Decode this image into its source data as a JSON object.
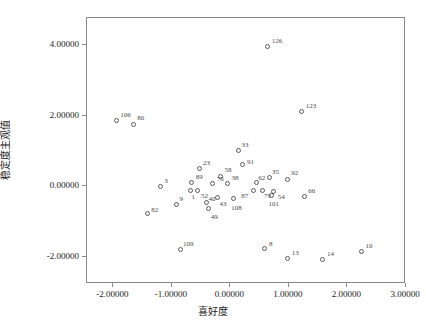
{
  "chart_data": {
    "type": "scatter",
    "title": "",
    "xlabel": "喜好度",
    "ylabel": "稳定度主观值",
    "xlim": [
      -2.45,
      3.0
    ],
    "ylim": [
      -2.75,
      4.75
    ],
    "grid": false,
    "legend": null,
    "xticks": [
      -2.0,
      -1.0,
      0.0,
      1.0,
      2.0,
      3.0
    ],
    "xtick_labels": [
      "-2.00000",
      "-1.00000",
      "0.00000",
      "1.00000",
      "2.00000",
      "3.00000"
    ],
    "yticks": [
      -2.0,
      0.0,
      2.0,
      4.0
    ],
    "ytick_labels": [
      "-2.00000",
      "0.00000",
      "2.00000",
      "4.00000"
    ],
    "point_color": "#5a5a5a",
    "marker": "open-circle",
    "labels_shown": true,
    "points": [
      {
        "label": "126",
        "x": 0.64,
        "y": 3.94,
        "lx": 4,
        "ly": -9
      },
      {
        "label": "123",
        "x": 1.22,
        "y": 2.11,
        "lx": 4,
        "ly": -9
      },
      {
        "label": "106",
        "x": -1.95,
        "y": 1.85,
        "lx": 4,
        "ly": -9
      },
      {
        "label": "80",
        "x": -1.66,
        "y": 1.76,
        "lx": 4,
        "ly": -9
      },
      {
        "label": "33",
        "x": 0.14,
        "y": 1.01,
        "lx": 3,
        "ly": -9
      },
      {
        "label": "91",
        "x": 0.2,
        "y": 0.62,
        "lx": 5,
        "ly": -5
      },
      {
        "label": "23",
        "x": -0.52,
        "y": 0.5,
        "lx": 3,
        "ly": -9
      },
      {
        "label": "58",
        "x": -0.17,
        "y": 0.29,
        "lx": 4,
        "ly": -9
      },
      {
        "label": "35",
        "x": 0.66,
        "y": 0.25,
        "lx": 3,
        "ly": -9
      },
      {
        "label": "92",
        "x": 0.97,
        "y": 0.21,
        "lx": 4,
        "ly": -9
      },
      {
        "label": "89",
        "x": -0.66,
        "y": 0.12,
        "lx": 4,
        "ly": -8
      },
      {
        "label": "76",
        "x": -0.3,
        "y": 0.08,
        "lx": 4,
        "ly": -8
      },
      {
        "label": "38",
        "x": -0.05,
        "y": 0.09,
        "lx": 4,
        "ly": -8
      },
      {
        "label": "62",
        "x": 0.44,
        "y": 0.1,
        "lx": 2,
        "ly": -8
      },
      {
        "label": "3",
        "x": -1.2,
        "y": 0.0,
        "lx": 4,
        "ly": -8
      },
      {
        "label": "1",
        "x": -0.68,
        "y": -0.1,
        "lx": 1,
        "ly": 4
      },
      {
        "label": "52",
        "x": -0.57,
        "y": -0.1,
        "lx": 4,
        "ly": 3
      },
      {
        "label": "87",
        "x": 0.39,
        "y": -0.12,
        "lx": -12,
        "ly": 2
      },
      {
        "label": "79",
        "x": 0.54,
        "y": -0.1,
        "lx": 2,
        "ly": 3
      },
      {
        "label": "54",
        "x": 0.74,
        "y": -0.15,
        "lx": 4,
        "ly": 2
      },
      {
        "label": "66",
        "x": 1.26,
        "y": -0.28,
        "lx": 4,
        "ly": -8
      },
      {
        "label": "101",
        "x": 0.7,
        "y": -0.26,
        "lx": -3,
        "ly": 5
      },
      {
        "label": "43",
        "x": -0.22,
        "y": -0.3,
        "lx": 2,
        "ly": 4
      },
      {
        "label": "108",
        "x": 0.05,
        "y": -0.34,
        "lx": -2,
        "ly": 6
      },
      {
        "label": "40",
        "x": -0.41,
        "y": -0.46,
        "lx": 2,
        "ly": -7
      },
      {
        "label": "49",
        "x": -0.37,
        "y": -0.63,
        "lx": 2,
        "ly": 5
      },
      {
        "label": "9",
        "x": -0.92,
        "y": -0.5,
        "lx": 3,
        "ly": -8
      },
      {
        "label": "82",
        "x": -1.42,
        "y": -0.77,
        "lx": 4,
        "ly": -7
      },
      {
        "label": "109",
        "x": -0.86,
        "y": -1.77,
        "lx": 3,
        "ly": -8
      },
      {
        "label": "8",
        "x": 0.59,
        "y": -1.75,
        "lx": 4,
        "ly": -8
      },
      {
        "label": "13",
        "x": 0.98,
        "y": -2.02,
        "lx": 4,
        "ly": -8
      },
      {
        "label": "14",
        "x": 1.58,
        "y": -2.05,
        "lx": 4,
        "ly": -8
      },
      {
        "label": "10",
        "x": 2.24,
        "y": -1.83,
        "lx": 4,
        "ly": -8
      }
    ]
  }
}
